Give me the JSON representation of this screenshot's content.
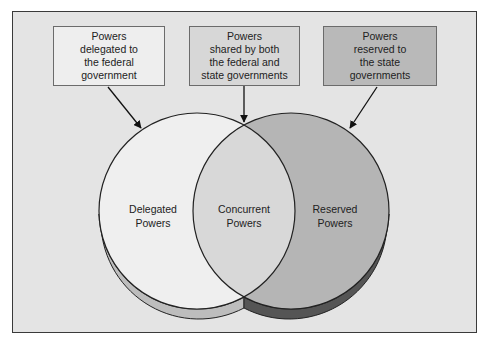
{
  "diagram": {
    "type": "venn",
    "colors": {
      "frame_bg": "#e4e4e4",
      "delegated_fill": "#efefef",
      "concurrent_fill": "#d8d8d8",
      "reserved_fill": "#b5b5b5",
      "delegated_edge": "#bdbdbd",
      "reserved_edge": "#555555"
    },
    "boxes": [
      {
        "text": "Powers\ndelegated to\nthe federal\ngovernment"
      },
      {
        "text": "Powers\nshared by both\nthe federal and\nstate governments"
      },
      {
        "text": "Powers\nreserved to\nthe state\ngovernments"
      }
    ],
    "regions": {
      "delegated": "Delegated\nPowers",
      "concurrent": "Concurrent\nPowers",
      "reserved": "Reserved\nPowers"
    }
  }
}
